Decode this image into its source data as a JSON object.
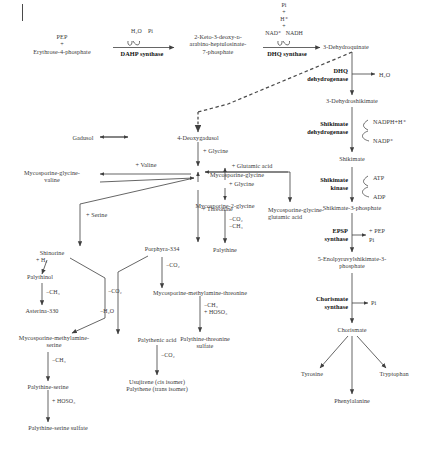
{
  "diagram": {
    "background": "#ffffff",
    "line_color": "#4a4a4a",
    "text_color": "#3a3a3a",
    "enzyme_color": "#111111"
  },
  "top": {
    "clipped_header": "",
    "substrate_left": "PEP\n+\nErythrose-4-phosphate",
    "dahp_cofactors": "H₂O    Pi",
    "dahp_enzyme": "DAHP synthase",
    "kdah": "2-Keto-3-deoxy-ᴅ-\narabino-heptulosinate-\n7-phosphate",
    "dhq_cofactors": "Pi\n+\nH⁺\n+",
    "dhq_nad": "NAD⁺   NADH",
    "dhq_enzyme": "DHQ synthase",
    "dehydroquinate": "3-Dehydroquinate"
  },
  "shikimate_branch": {
    "dhq_dehydrogenase": "DHQ\ndehydrogenase",
    "water_out": "H₂O",
    "dehydroshikimate": "3-Dehydroshikimate",
    "shikimate_dehydrogenase": "Shikimate\ndehydrogenase",
    "nadph_in": "NADPH+H⁺",
    "nadp_out": "NADP⁺",
    "shikimate": "Shikimate",
    "shikimate_kinase": "Shikimate\nkinase",
    "atp_in": "ATP",
    "adp_out": "ADP",
    "shikimate_3_phosphate": "Shikimate-3-phosphate",
    "epsp_synthase": "EPSP\nsynthase",
    "pep_in": "+ PEP",
    "pi_out": "Pi",
    "epsp": "5-Enolpyruvylshikimate-3-\nphosphate",
    "chorismate_synthase": "Chorismate\nsynthase",
    "chorismate_pi": "Pi",
    "chorismate": "Chorismate",
    "tyrosine": "Tyrosine",
    "phenylalanine": "Phenylalanine",
    "tryptophan": "Tryptophan"
  },
  "maa_branch": {
    "gadusol": "Gadusol",
    "deoxygadusol": "4-Deoxygadusol",
    "glycine_add_1": "+ Glycine",
    "mycosporine_glycine": "Mycosporine-glycine",
    "valine_add": "+ Valine",
    "mycosporine_glycine_valine": "Mycosporine-glycine-\nvaline",
    "glutamic_add": "+ Glutamic acid",
    "mycosporine_glycine_glutamic": "Mycosporine-glycine-\nglutamic acid",
    "glycine_add_2": "+ Glycine",
    "mycosporine_2_glycine": "Mycosporine-2-glycine",
    "palythine_loss": "−CO₂\n−CH₃",
    "palythine": "Palythine",
    "threonine_add": "+ Threonine",
    "porphyra_334": "Porphyra-334",
    "serine_add": "+ Serine",
    "shinorine": "Shinorine",
    "h2_add": "+ H₂",
    "palythinol": "Palythinol",
    "ch3_loss": "−CH₃",
    "asterina_330": "Asterina-330",
    "co2_loss_serine": "−CO₂",
    "mycosporine_methylamine_serine": "Mycosporine-methylamine-\nserine",
    "ch3_loss_2": "−CH₃",
    "palythine_serine": "Palythine-serine",
    "hoso3_add": "+ HOSO₃",
    "palythine_serine_sulfate": "Palythine-serine sulfate",
    "co2_loss_threonine": "−CO₂",
    "mycosporine_methylamine_threonine": "Mycosporine-methylamine-threonine",
    "threonine_sulfate_loss": "−CH₃\n+ HOSO₃",
    "palythine_threonine_sulfate": "Palythine-threonine\nsulfate",
    "h2o_loss": "−H₂O",
    "palythenic_acid": "Palythenic acid",
    "co2_loss_palythenic": "−CO₂",
    "usujirene_palythene": "Usujirene (cis isomer)\nPalythene (trans isomer)"
  }
}
